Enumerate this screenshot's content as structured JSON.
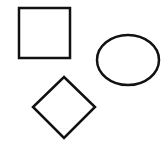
{
  "canvas": {
    "width": 161,
    "height": 150,
    "background": "#ffffff"
  },
  "stroke": {
    "color": "#111111",
    "width": 2.5
  },
  "shapes": [
    {
      "name": "square",
      "type": "rect",
      "x": 19,
      "y": 8,
      "width": 51,
      "height": 50
    },
    {
      "name": "ellipse",
      "type": "ellipse",
      "cx": 128,
      "cy": 60,
      "rx": 31,
      "ry": 25
    },
    {
      "name": "diamond",
      "type": "polygon",
      "points": "64,77 95,107 64,138 33,107"
    }
  ]
}
